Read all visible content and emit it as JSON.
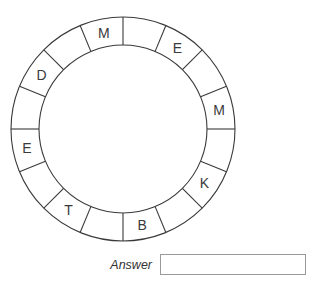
{
  "puzzle": {
    "ring": {
      "center": [
        123,
        129
      ],
      "outer_radius": 112,
      "inner_radius": 84,
      "segment_count": 16,
      "line_color": "#3a3a3a",
      "segments": [
        "",
        "E",
        "",
        "M",
        "",
        "K",
        "",
        "B",
        "",
        "T",
        "",
        "E",
        "",
        "D",
        "",
        "M"
      ]
    },
    "answer": {
      "label": "Answer",
      "value": ""
    }
  }
}
